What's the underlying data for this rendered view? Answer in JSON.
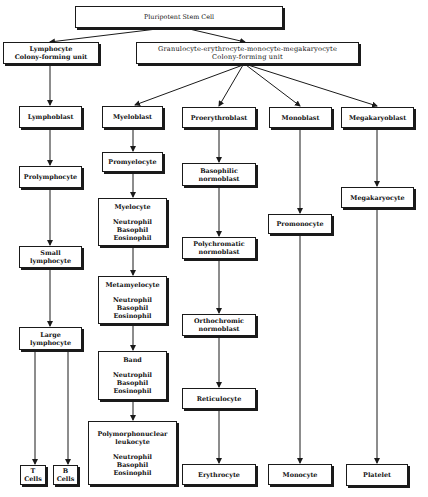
{
  "diagram": {
    "nodes": {
      "pluripotent": {
        "label": "Pluripotent Stem Cell"
      },
      "lymph_cfu": {
        "label": "Lymphocyte\nColony-forming  unit"
      },
      "gemm_cfu": {
        "label": "Granulocyte-erythrocyte-monocyte-megakaryocyte\nColony-forming  unit"
      },
      "lymphoblast": {
        "label": "Lymphoblast"
      },
      "prolymphocyte": {
        "label": "Prolymphocyte"
      },
      "small_lymphocyte": {
        "label": "Small lymphocyte"
      },
      "large_lymphocyte": {
        "label": "Large\nlymphocyte"
      },
      "t_cells": {
        "label": "T\nCells"
      },
      "b_cells": {
        "label": "B\nCells"
      },
      "myeloblast": {
        "label": "Myeloblast"
      },
      "promyelocyte": {
        "label": "Promyelocyte"
      },
      "myelocyte": {
        "label": "Myelocyte",
        "sub": "Neutrophil\nBasophil\nEosinophil"
      },
      "metamyelocyte": {
        "label": "Metamyelocyte",
        "sub": "Neutrophil\nBasophil\nEosinophil"
      },
      "band": {
        "label": "Band",
        "sub": "Neutrophil\nBasophil\nEosinophil"
      },
      "pmn": {
        "label": "Polymorphonuclear\nleukocyte",
        "sub": "Neutrophil\nBasophil\nEosinophil"
      },
      "proerythroblast": {
        "label": "Proerythroblast"
      },
      "basophilic_normoblast": {
        "label": "Basophilic\nnormoblast"
      },
      "polychromatic_normoblast": {
        "label": "Polychromatic\nnormoblast"
      },
      "orthochromic_normoblast": {
        "label": "Orthochromic\nnormoblast"
      },
      "reticulocyte": {
        "label": "Reticulocyte"
      },
      "erythrocyte": {
        "label": "Erythrocyte"
      },
      "monoblast": {
        "label": "Monoblast"
      },
      "promonocyte": {
        "label": "Promonocyte"
      },
      "monocyte": {
        "label": "Monocyte"
      },
      "megakaryoblast": {
        "label": "Megakaryoblast"
      },
      "megakaryocyte": {
        "label": "Megakaryocyte"
      },
      "platelet": {
        "label": "Platelet"
      }
    },
    "edges": [
      [
        "pluripotent",
        "lymph_cfu"
      ],
      [
        "pluripotent",
        "gemm_cfu"
      ],
      [
        "lymph_cfu",
        "lymphoblast"
      ],
      [
        "lymphoblast",
        "prolymphocyte"
      ],
      [
        "prolymphocyte",
        "small_lymphocyte"
      ],
      [
        "small_lymphocyte",
        "large_lymphocyte"
      ],
      [
        "large_lymphocyte",
        "t_cells"
      ],
      [
        "large_lymphocyte",
        "b_cells"
      ],
      [
        "gemm_cfu",
        "myeloblast"
      ],
      [
        "gemm_cfu",
        "proerythroblast"
      ],
      [
        "gemm_cfu",
        "monoblast"
      ],
      [
        "gemm_cfu",
        "megakaryoblast"
      ],
      [
        "myeloblast",
        "promyelocyte"
      ],
      [
        "promyelocyte",
        "myelocyte"
      ],
      [
        "myelocyte",
        "metamyelocyte"
      ],
      [
        "metamyelocyte",
        "band"
      ],
      [
        "band",
        "pmn"
      ],
      [
        "proerythroblast",
        "basophilic_normoblast"
      ],
      [
        "basophilic_normoblast",
        "polychromatic_normoblast"
      ],
      [
        "polychromatic_normoblast",
        "orthochromic_normoblast"
      ],
      [
        "orthochromic_normoblast",
        "reticulocyte"
      ],
      [
        "reticulocyte",
        "erythrocyte"
      ],
      [
        "monoblast",
        "promonocyte"
      ],
      [
        "promonocyte",
        "monocyte"
      ],
      [
        "megakaryoblast",
        "megakaryocyte"
      ],
      [
        "megakaryocyte",
        "platelet"
      ]
    ],
    "colors": {
      "line": "#1a1a1a",
      "background": "#ffffff"
    }
  }
}
